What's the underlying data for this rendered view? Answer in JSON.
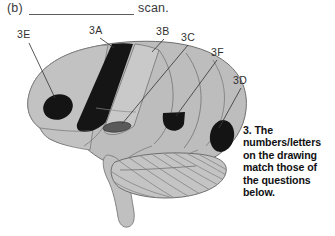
{
  "header": {
    "prefix": "(b)",
    "blank_answer": "",
    "suffix": "scan."
  },
  "figure": {
    "callouts": [
      {
        "id": "3E",
        "label": "3E"
      },
      {
        "id": "3A",
        "label": "3A"
      },
      {
        "id": "3B",
        "label": "3B"
      },
      {
        "id": "3C",
        "label": "3C"
      },
      {
        "id": "3F",
        "label": "3F"
      },
      {
        "id": "3D",
        "label": "3D"
      }
    ]
  },
  "instruction": {
    "text": "3. The numbers/letters on the drawing match those of the questions below."
  },
  "colors": {
    "page_background": "#ffffff",
    "brain_fill": "#b8b8b8",
    "brain_fill_light": "#c6c6c6",
    "brain_outline": "#6e6e70",
    "structure_black": "#131313",
    "structure_dark_gray": "#585858",
    "text": "#2f2f31",
    "rule": "#5c5c5e"
  }
}
